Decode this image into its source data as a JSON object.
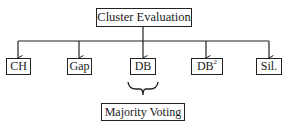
{
  "root": {
    "label": "Cluster Evaluation"
  },
  "metrics": [
    {
      "label": "CH",
      "sup": ""
    },
    {
      "label": "Gap",
      "sup": ""
    },
    {
      "label": "DB",
      "sup": ""
    },
    {
      "label": "DB",
      "sup": "2"
    },
    {
      "label": "Sil.",
      "sup": ""
    }
  ],
  "aggregator": {
    "label": "Majority Voting"
  },
  "colors": {
    "line": "#222222",
    "background": "#ffffff"
  }
}
